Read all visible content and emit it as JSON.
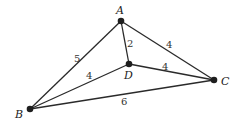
{
  "graph": {
    "nodes": [
      {
        "id": "A",
        "label": "A",
        "x": 121,
        "y": 21
      },
      {
        "id": "B",
        "label": "B",
        "x": 30,
        "y": 109
      },
      {
        "id": "C",
        "label": "C",
        "x": 214,
        "y": 80
      },
      {
        "id": "D",
        "label": "D",
        "x": 129,
        "y": 64
      }
    ],
    "edges": [
      {
        "from": "A",
        "to": "B",
        "weight": "5"
      },
      {
        "from": "A",
        "to": "D",
        "weight": "2"
      },
      {
        "from": "A",
        "to": "C",
        "weight": "4"
      },
      {
        "from": "D",
        "to": "B",
        "weight": "4"
      },
      {
        "from": "D",
        "to": "C",
        "weight": "4"
      },
      {
        "from": "B",
        "to": "C",
        "weight": "6"
      }
    ]
  }
}
